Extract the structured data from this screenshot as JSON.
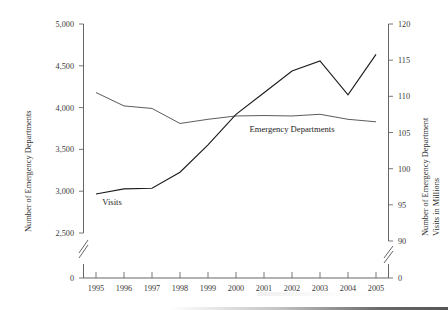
{
  "chart_data": {
    "type": "line",
    "title": "",
    "subtitle": "",
    "xlabel": "",
    "x": [
      1995,
      1996,
      1997,
      1998,
      1999,
      2000,
      2001,
      2002,
      2003,
      2004,
      2005
    ],
    "xtick_labels": [
      "1995",
      "1996",
      "1997",
      "1998",
      "1999",
      "2000",
      "2001",
      "2002",
      "2003",
      "2004",
      "2005"
    ],
    "grid": false,
    "legend_position": "inline-annotations",
    "axes": [
      {
        "side": "left",
        "label": "Number of Emergency Departments",
        "ylim": [
          2500,
          5000
        ],
        "ticks": [
          2500,
          3000,
          3500,
          4000,
          4500,
          5000
        ],
        "tick_labels": [
          "2,500",
          "3,000",
          "3,500",
          "4,000",
          "4,500",
          "5,000"
        ],
        "zero_tick_label": "0",
        "axis_break": true
      },
      {
        "side": "right",
        "label": "Number of Emergency Department Visits in Millions",
        "ylim": [
          90,
          120
        ],
        "ticks": [
          90,
          95,
          100,
          105,
          110,
          115,
          120
        ],
        "tick_labels": [
          "90",
          "95",
          "100",
          "105",
          "110",
          "115",
          "120"
        ],
        "zero_tick_label": "0",
        "axis_break": true
      }
    ],
    "series": [
      {
        "name": "Emergency Departments",
        "axis": "left",
        "inline_label": "Emergency Departments",
        "unit": "departments",
        "color": "#5c5c5c",
        "values": [
          4180,
          4020,
          3990,
          3810,
          3860,
          3900,
          3905,
          3900,
          3920,
          3860,
          3830
        ]
      },
      {
        "name": "Visits",
        "axis": "right",
        "inline_label": "Visits",
        "unit": "millions of visits",
        "color": "#1d1d1d",
        "values": [
          96.5,
          97.2,
          97.3,
          99.5,
          103.3,
          107.5,
          110.5,
          113.5,
          114.9,
          110.2,
          115.8
        ]
      }
    ],
    "annotations": [
      {
        "text": "Visits",
        "series": "Visits",
        "near_x": 1995
      },
      {
        "text": "Emergency Departments",
        "series": "Emergency Departments",
        "near_x": 2001
      }
    ]
  }
}
